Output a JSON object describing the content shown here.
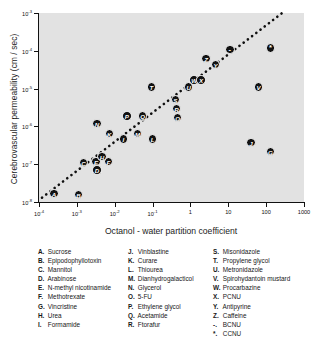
{
  "chart_data": {
    "type": "scatter",
    "title": "",
    "xlabel": "Octanol - water partition coefficient",
    "ylabel": "Cerebrovascular permeability  (cm / sec)",
    "xscale": "log",
    "yscale": "log",
    "xlim": [
      0.0001,
      1000
    ],
    "ylim": [
      1e-08,
      0.001
    ],
    "grid": false,
    "legend_position": "below-plot",
    "xticklabels": [
      "10⁻⁴",
      "10⁻³",
      "10⁻²",
      "10⁻¹",
      "1",
      "10",
      "100",
      "1000"
    ],
    "xtickvalues": [
      0.0001,
      0.001,
      0.01,
      0.1,
      1,
      10,
      100,
      1000
    ],
    "yticklabels": [
      "10⁻³",
      "10⁻⁴",
      "10⁻⁵",
      "10⁻⁶",
      "10⁻⁷",
      "10⁻⁸"
    ],
    "ytickvalues": [
      0.001,
      0.0001,
      1e-05,
      1e-06,
      1e-07,
      1e-08
    ],
    "trendline": {
      "style": "dotted",
      "x": [
        0.00012,
        300
      ],
      "y": [
        1.3e-08,
        0.0011
      ]
    },
    "points": [
      {
        "key": "A",
        "name": "Sucrose",
        "x": 0.00025,
        "y": 1.7e-08,
        "filled": true
      },
      {
        "key": "B",
        "name": "Epipodophyllotoxin",
        "x": 0.0011,
        "y": 1.6e-08,
        "filled": true
      },
      {
        "key": "C",
        "name": "Mannitol",
        "x": 0.0015,
        "y": 1.1e-07,
        "filled": true
      },
      {
        "key": "D",
        "name": "Arabinose",
        "x": 0.0034,
        "y": 7e-08,
        "filled": true
      },
      {
        "key": "E",
        "name": "N-methyl nicotinamide",
        "x": 0.0032,
        "y": 1.2e-07,
        "filled": true
      },
      {
        "key": "F",
        "name": "Methotrexate",
        "x": 0.0068,
        "y": 1.2e-07,
        "filled": true
      },
      {
        "key": "G",
        "name": "Vincristine",
        "x": 130,
        "y": 2.2e-07,
        "filled": true
      },
      {
        "key": "H",
        "name": "Urea",
        "x": 0.0046,
        "y": 1.6e-07,
        "filled": true
      },
      {
        "key": "I",
        "name": "Formamide",
        "x": 0.017,
        "y": 4.6e-07,
        "filled": true
      },
      {
        "key": "J",
        "name": "Vinblastine",
        "x": 40,
        "y": 3.7e-07,
        "filled": true
      },
      {
        "key": "K",
        "name": "Curare",
        "x": 0.0072,
        "y": 6.5e-07,
        "filled": true
      },
      {
        "key": "L",
        "name": "Thiourea",
        "x": 0.1,
        "y": 4.6e-07,
        "filled": true
      },
      {
        "key": "M",
        "name": "Dianhydrogalacticol",
        "x": 0.04,
        "y": 6.4e-07,
        "filled": true
      },
      {
        "key": "N",
        "name": "Glycerol",
        "x": 0.0034,
        "y": 1.2e-06,
        "filled": true
      },
      {
        "key": "O",
        "name": "5-FU",
        "x": 0.46,
        "y": 1.7e-06,
        "filled": true
      },
      {
        "key": "P",
        "name": "Ethylene glycol",
        "x": 0.021,
        "y": 1.9e-06,
        "filled": true
      },
      {
        "key": "Q",
        "name": "Acetamide",
        "x": 0.055,
        "y": 1.9e-06,
        "filled": true
      },
      {
        "key": "R",
        "name": "Ftorafur",
        "x": 0.43,
        "y": 3e-06,
        "filled": true
      },
      {
        "key": "S",
        "name": "Misonidazole",
        "x": 0.4,
        "y": 5.2e-06,
        "filled": true
      },
      {
        "key": "T",
        "name": "Propylene glycol",
        "x": 0.093,
        "y": 1.1e-05,
        "filled": true
      },
      {
        "key": "U",
        "name": "Metronidazole",
        "x": 0.9,
        "y": 1.1e-05,
        "filled": true
      },
      {
        "key": "V",
        "name": "Spirohydantoin mustard",
        "x": 63,
        "y": 1.1e-05,
        "filled": true
      },
      {
        "key": "W",
        "name": "Procarbazine",
        "x": 1.25,
        "y": 1.7e-05,
        "filled": true
      },
      {
        "key": "X",
        "name": "PCNU",
        "x": 1.9,
        "y": 1.7e-05,
        "filled": true
      },
      {
        "key": "Y",
        "name": "Antipyrine",
        "x": 4.6,
        "y": 4.4e-05,
        "filled": true
      },
      {
        "key": "Z",
        "name": "Caffeine",
        "x": 2.6,
        "y": 6.3e-05,
        "filled": true
      },
      {
        "key": "-",
        "name": "BCNU",
        "x": 11,
        "y": 0.00011,
        "filled": true
      },
      {
        "key": "*",
        "name": "CCNU",
        "x": 130,
        "y": 0.00012,
        "filled": true
      }
    ]
  },
  "legend": {
    "columns": [
      [
        {
          "key": "A.",
          "name": "Sucrose"
        },
        {
          "key": "B.",
          "name": "Epipodophyllotoxin"
        },
        {
          "key": "C.",
          "name": "Mannitol"
        },
        {
          "key": "D.",
          "name": "Arabinose"
        },
        {
          "key": "E.",
          "name": "N-methyl nicotinamide"
        },
        {
          "key": "F.",
          "name": "Methotrexate"
        },
        {
          "key": "G.",
          "name": "Vincristine"
        },
        {
          "key": "H.",
          "name": "Urea"
        },
        {
          "key": "I.",
          "name": "Formamide"
        }
      ],
      [
        {
          "key": "J.",
          "name": "Vinblastine"
        },
        {
          "key": "K.",
          "name": "Curare"
        },
        {
          "key": "L.",
          "name": "Thiourea"
        },
        {
          "key": "M.",
          "name": "Dianhydrogalacticol"
        },
        {
          "key": "N.",
          "name": "Glycerol"
        },
        {
          "key": "O.",
          "name": "5-FU"
        },
        {
          "key": "P.",
          "name": "Ethylene glycol"
        },
        {
          "key": "Q.",
          "name": "Acetamide"
        },
        {
          "key": "R.",
          "name": "Ftorafur"
        }
      ],
      [
        {
          "key": "S.",
          "name": "Misonidazole"
        },
        {
          "key": "T.",
          "name": "Propylene glycol"
        },
        {
          "key": "U.",
          "name": "Metronidazole"
        },
        {
          "key": "V.",
          "name": "Spirohydantoin mustard"
        },
        {
          "key": "W.",
          "name": "Procarbazine"
        },
        {
          "key": "X.",
          "name": "PCNU"
        },
        {
          "key": "Y.",
          "name": "Antipyrine"
        },
        {
          "key": "Z.",
          "name": "Caffeine"
        },
        {
          "key": "-.",
          "name": "BCNU"
        },
        {
          "key": "*.",
          "name": "CCNU"
        }
      ]
    ]
  },
  "colors": {
    "plot_background": "#e2e2e2",
    "page_background": "#ffffff",
    "axis": "#111111",
    "marker": "#121212",
    "marker_text": "#ffffff",
    "text": "#171717"
  }
}
